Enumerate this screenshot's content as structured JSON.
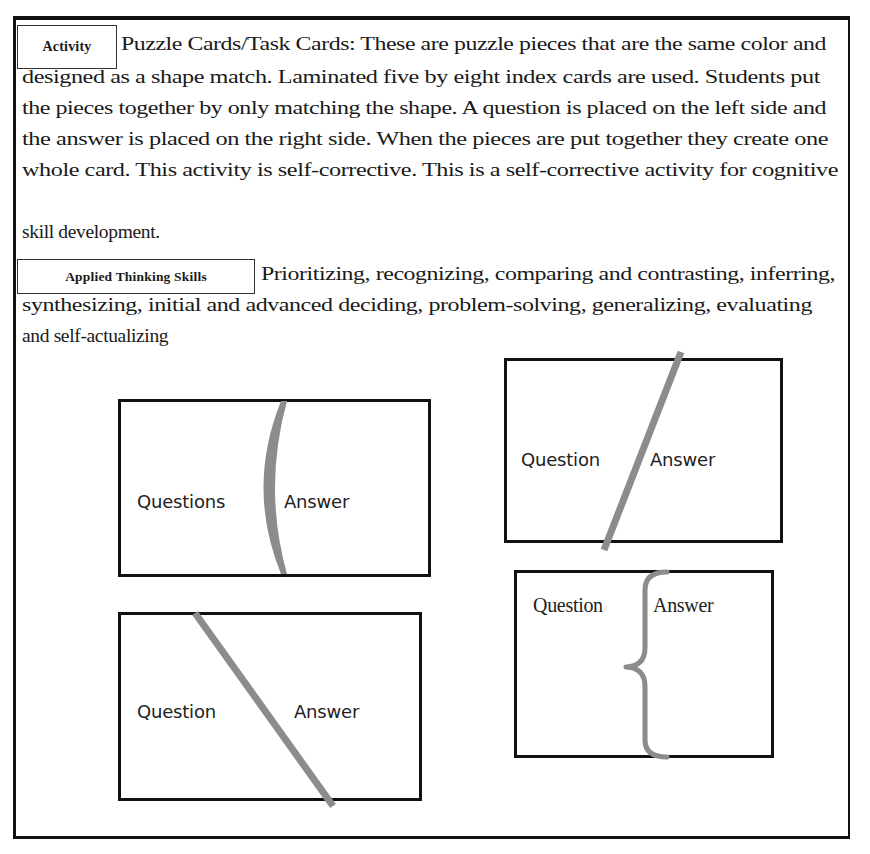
{
  "document": {
    "activity_label": "Activity",
    "activity_lines": [
      "Puzzle Cards/Task Cards: These are puzzle pieces that are the same color  and",
      "designed  as a shape match.  Laminated  five by eight index  cards are used. Students put",
      "the pieces together by only  matching the shape.  A question is placed on the left side and",
      "the answer is placed on the right  side.  When the pieces are put together they create one",
      "whole  card. This activity  is  self-corrective. This is a self-corrective activity  for cognitive",
      "skill  development."
    ],
    "skills_label": "Applied Thinking Skills",
    "skills_lines": [
      "Prioritizing,  recognizing,  comparing and contrasting, inferring,",
      "synthesizing,  initial  and advanced deciding, problem-solving,  generalizing,  evaluating",
      "and self-actualizing"
    ]
  },
  "diagrams": {
    "divider_color": "#8c8c8c",
    "cards": [
      {
        "id": "curved-divider-card",
        "divider": "crescent",
        "left_label": "Questions",
        "right_label": "Answer"
      },
      {
        "id": "forward-slash-card",
        "divider": "forward-diagonal",
        "left_label": "Question",
        "right_label": "Answer"
      },
      {
        "id": "back-slash-card",
        "divider": "back-diagonal",
        "left_label": "Question",
        "right_label": "Answer"
      },
      {
        "id": "brace-card",
        "divider": "curly-brace",
        "left_label": "Question",
        "right_label": "Answer"
      }
    ]
  }
}
